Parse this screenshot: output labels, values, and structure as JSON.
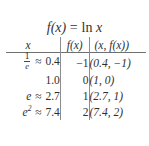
{
  "figure": {
    "title": {
      "fn": "f(x)",
      "equals": "=",
      "expr_op": "ln",
      "expr_arg": "x",
      "full": "f(x) = ln x"
    },
    "table": {
      "headers": {
        "col1": "x",
        "col2": "f(x)",
        "col3": "(x, f(x))"
      },
      "rows": [
        {
          "x_expr_num": "1",
          "x_expr_den": "e",
          "approx": "≈",
          "x_value": "0.4",
          "fx": "−1",
          "point": "(0.4, −1)"
        },
        {
          "x_expr_num": "",
          "x_expr_den": "",
          "approx": "",
          "x_value": "1.0",
          "fx": "0",
          "point": "(1, 0)"
        },
        {
          "x_expr_num": "e",
          "x_expr_den": "",
          "approx": "≈",
          "x_value": "2.7",
          "fx": "1",
          "point": "(2.7, 1)"
        },
        {
          "x_expr_num": "e",
          "x_expr_exp": "2",
          "x_expr_den": "",
          "approx": "≈",
          "x_value": "7.4",
          "fx": "2",
          "point": "(7.4, 2)"
        }
      ]
    },
    "colors": {
      "background": "#ffffff",
      "text": "#2f2f2f",
      "rule": "#6f6f6f"
    }
  },
  "chart_data": {
    "type": "table",
    "title": "f(x) = ln x",
    "columns": [
      "x",
      "f(x)",
      "(x, f(x))"
    ],
    "rows": [
      [
        "1/e ≈ 0.4",
        "−1",
        "(0.4, −1)"
      ],
      [
        "1.0",
        "0",
        "(1, 0)"
      ],
      [
        "e ≈ 2.7",
        "1",
        "(2.7, 1)"
      ],
      [
        "e² ≈ 7.4",
        "2",
        "(7.4, 2)"
      ]
    ],
    "x": [
      0.4,
      1.0,
      2.7,
      7.4
    ],
    "values": [
      -1,
      0,
      1,
      2
    ],
    "xlabel": "x",
    "ylabel": "f(x)"
  }
}
